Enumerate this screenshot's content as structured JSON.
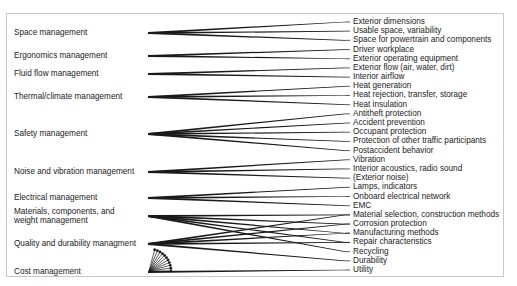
{
  "diagram": {
    "type": "many-to-many relationship diagram",
    "left_categories": [
      {
        "id": "space",
        "label": "Space management",
        "y": 33
      },
      {
        "id": "ergonomics",
        "label": "Ergonomics management",
        "y": 56
      },
      {
        "id": "fluid",
        "label": "Fluid flow management",
        "y": 74
      },
      {
        "id": "thermal",
        "label": "Thermal/climate management",
        "y": 97
      },
      {
        "id": "safety",
        "label": "Safety management",
        "y": 134
      },
      {
        "id": "noise",
        "label": "Noise and vibration management",
        "y": 172
      },
      {
        "id": "electrical",
        "label": "Electrical management",
        "y": 198
      },
      {
        "id": "materials",
        "label": "Materials, components, and weight management",
        "line1": "Materials, components, and",
        "line2": "weight management",
        "y": 216
      },
      {
        "id": "quality",
        "label": "Quality and durability managment",
        "y": 244
      },
      {
        "id": "cost",
        "label": "Cost management",
        "y": 272
      }
    ],
    "right_items": [
      "Exterior dimensions",
      "Usable space, variability",
      "Space for powertrain and components",
      "Driver workplace",
      "Exterior operating equipment",
      "Exterior flow (air, water, dirt)",
      "Interior airflow",
      "Heat generation",
      "Heat rejection, transfer, storage",
      "Heat insulation",
      "Antitheft protection",
      "Accident prevention",
      "Occupant protection",
      "Protection of other traffic participants",
      "Postaccident behavior",
      "Vibration",
      "Interior acoustics, radio sound",
      "(Exterior noise)",
      "Lamps, indicators",
      "Onboard electrical network",
      "EMC",
      "Material selection, construction methods",
      "Corrosion protection",
      "Manufacturing methods",
      "Repair characteristics",
      "Recycling",
      "Durability",
      "Utility"
    ],
    "connections": {
      "space": [
        0,
        1,
        2
      ],
      "ergonomics": [
        3,
        4
      ],
      "fluid": [
        5,
        6
      ],
      "thermal": [
        7,
        8,
        9
      ],
      "safety": [
        10,
        11,
        12,
        13,
        14
      ],
      "noise": [
        15,
        16,
        17
      ],
      "electrical": [
        18,
        19,
        20
      ],
      "materials": [
        21,
        22,
        23,
        24,
        25
      ],
      "quality": [
        21,
        22,
        23,
        24,
        26
      ],
      "cost": [
        27
      ]
    },
    "line_color": "#1a1a1a",
    "frame_color": "#c8c8c8"
  }
}
